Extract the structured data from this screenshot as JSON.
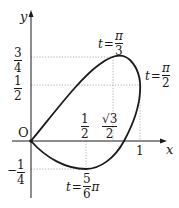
{
  "diagram": {
    "type": "parametric-curve-plot",
    "axes": {
      "x_label": "x",
      "y_label": "y",
      "origin_label": "O"
    },
    "x_ticks": [
      {
        "num": "1",
        "den": "2",
        "value": 0.5
      },
      {
        "num": "√3",
        "den": "2",
        "value": 0.866
      },
      {
        "label": "1",
        "value": 1
      }
    ],
    "y_ticks": [
      {
        "num": "3",
        "den": "4",
        "value": 0.75
      },
      {
        "num": "1",
        "den": "2",
        "value": 0.5
      },
      {
        "sign": "−",
        "num": "1",
        "den": "4",
        "value": -0.25
      }
    ],
    "annotations": [
      {
        "var": "t",
        "eq": "=",
        "num": "π",
        "den": "3",
        "point": [
          0.75,
          0.75
        ]
      },
      {
        "var": "t",
        "eq": "=",
        "num": "π",
        "den": "2",
        "point": [
          1,
          0.5
        ]
      },
      {
        "var": "t",
        "eq": "=",
        "num": "5",
        "den": "6",
        "suffix": "π",
        "point": [
          0.5,
          -0.25
        ]
      }
    ],
    "colors": {
      "curve": "#1a1a1a",
      "axis": "#1a1a1a",
      "guide": "#999999"
    }
  }
}
